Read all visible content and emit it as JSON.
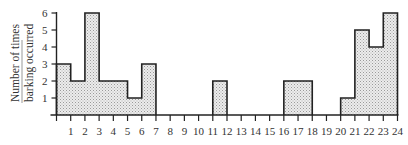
{
  "chart_data": {
    "type": "bar",
    "subtype": "step-histogram",
    "title": "",
    "xlabel": "",
    "ylabel": [
      "Number of times",
      "barking occurred"
    ],
    "x_ticks": [
      1,
      2,
      3,
      4,
      5,
      6,
      7,
      8,
      9,
      10,
      11,
      12,
      13,
      14,
      15,
      16,
      17,
      18,
      19,
      20,
      21,
      22,
      23,
      24
    ],
    "y_ticks": [
      1,
      2,
      3,
      4,
      5,
      6
    ],
    "xlim": [
      0,
      24
    ],
    "ylim": [
      0,
      6
    ],
    "grid": false,
    "legend": null,
    "bins": [
      {
        "start": 0,
        "end": 1,
        "value": 3
      },
      {
        "start": 1,
        "end": 2,
        "value": 2
      },
      {
        "start": 2,
        "end": 3,
        "value": 6
      },
      {
        "start": 3,
        "end": 4,
        "value": 2
      },
      {
        "start": 4,
        "end": 5,
        "value": 2
      },
      {
        "start": 5,
        "end": 6,
        "value": 1
      },
      {
        "start": 6,
        "end": 7,
        "value": 3
      },
      {
        "start": 7,
        "end": 8,
        "value": 0
      },
      {
        "start": 8,
        "end": 9,
        "value": 0
      },
      {
        "start": 9,
        "end": 10,
        "value": 0
      },
      {
        "start": 10,
        "end": 11,
        "value": 0
      },
      {
        "start": 11,
        "end": 12,
        "value": 2
      },
      {
        "start": 12,
        "end": 13,
        "value": 0
      },
      {
        "start": 13,
        "end": 14,
        "value": 0
      },
      {
        "start": 14,
        "end": 15,
        "value": 0
      },
      {
        "start": 15,
        "end": 16,
        "value": 0
      },
      {
        "start": 16,
        "end": 17,
        "value": 2
      },
      {
        "start": 17,
        "end": 18,
        "value": 2
      },
      {
        "start": 18,
        "end": 19,
        "value": 0
      },
      {
        "start": 19,
        "end": 20,
        "value": 0
      },
      {
        "start": 20,
        "end": 21,
        "value": 1
      },
      {
        "start": 21,
        "end": 22,
        "value": 5
      },
      {
        "start": 22,
        "end": 23,
        "value": 4
      },
      {
        "start": 23,
        "end": 24,
        "value": 6
      }
    ],
    "fill_color": "#e4e4e4",
    "line_color": "#222222"
  }
}
